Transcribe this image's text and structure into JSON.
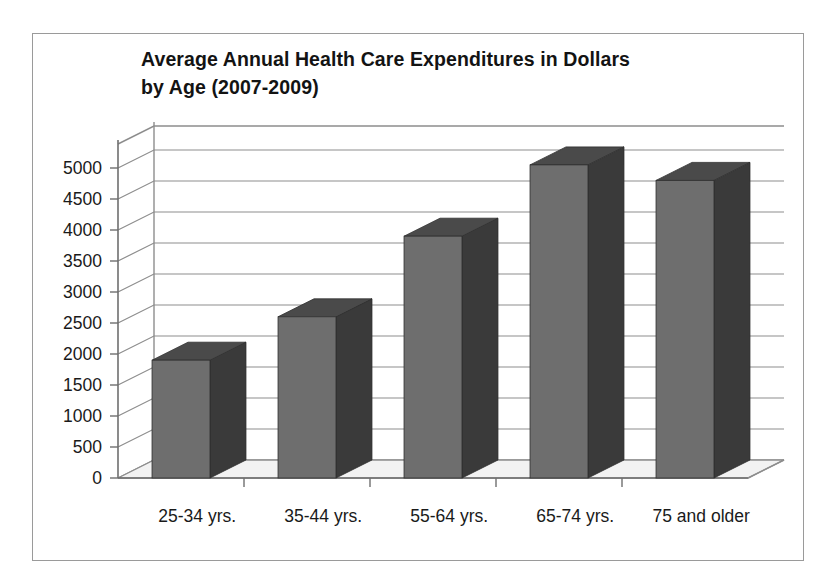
{
  "chart_data": {
    "type": "bar",
    "title": "Average Annual Health Care Expenditures in Dollars by Age  (2007-2009)",
    "title_line1": "Average Annual Health Care Expenditures in Dollars",
    "title_line2": "by Age  (2007-2009)",
    "categories": [
      "25-34 yrs.",
      "35-44 yrs.",
      "55-64 yrs.",
      "65-74 yrs.",
      "75 and older"
    ],
    "values": [
      1900,
      2600,
      3900,
      5050,
      4800
    ],
    "xlabel": "",
    "ylabel": "",
    "ylim": [
      0,
      5000
    ],
    "ytick_step": 500,
    "yticks": [
      "0",
      "500",
      "1000",
      "1500",
      "2000",
      "2500",
      "3000",
      "3500",
      "4000",
      "4500",
      "5000"
    ],
    "grid": true,
    "legend": false,
    "style": "3d-column",
    "colors": {
      "bar_front": "#6e6e6e",
      "bar_side": "#3a3a3a",
      "bar_top": "#4a4a4a",
      "gridline": "#8d8d8d",
      "text": "#1a1a1a",
      "frame_border": "#9a9a9a",
      "floor": "#f2f2f2",
      "background": "#ffffff"
    }
  }
}
